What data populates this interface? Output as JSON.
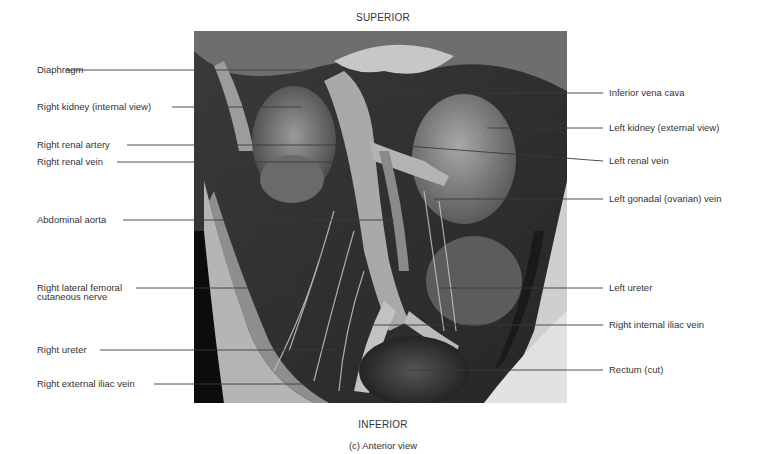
{
  "figure": {
    "orientation_top": "SUPERIOR",
    "orientation_bottom": "INFERIOR",
    "caption": "(c) Anterior view",
    "photo_description": "grayscale anatomical dissection photograph, anterior view of posterior abdominal wall"
  },
  "labels_left": [
    {
      "text": "Diaphragm",
      "y": 70,
      "x_end": 313
    },
    {
      "text": "Right kidney (internal view)",
      "y": 107,
      "x_end": 301
    },
    {
      "text": "Right renal artery",
      "y": 145,
      "x_end": 343
    },
    {
      "text": "Right renal vein",
      "y": 162,
      "x_end": 338
    },
    {
      "text": "Abdominal aorta",
      "y": 220,
      "x_end": 394
    },
    {
      "text": "Right lateral femoral",
      "text2": "cutaneous nerve",
      "y": 288,
      "x_end": 294
    },
    {
      "text": "Right ureter",
      "y": 350,
      "x_end": 336
    },
    {
      "text": "Right external iliac vein",
      "y": 384,
      "x_end": 313
    }
  ],
  "labels_right": [
    {
      "text": "Inferior vena cava",
      "y": 93,
      "x_start": 368
    },
    {
      "text": "Left kidney (external view)",
      "y": 128,
      "x_start": 487
    },
    {
      "text": "Left renal vein",
      "y": 161,
      "x_start": 393,
      "y_start": 145
    },
    {
      "text": "Left gonadal (ovarian) vein",
      "y": 199,
      "x_start": 434
    },
    {
      "text": "Left ureter",
      "y": 288,
      "x_start": 440
    },
    {
      "text": "Right internal iliac vein",
      "y": 325,
      "x_start": 367
    },
    {
      "text": "Rectum (cut)",
      "y": 370,
      "x_start": 409
    }
  ]
}
